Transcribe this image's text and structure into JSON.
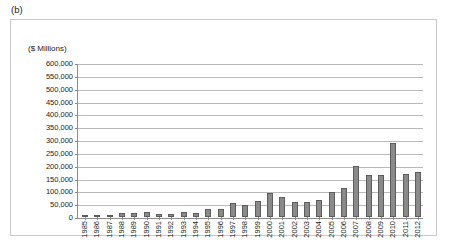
{
  "panel": {
    "label": "(b)"
  },
  "chart_data": {
    "type": "bar",
    "title": "",
    "subtitle": "",
    "ylabel": "($ Millions)",
    "xlabel": "",
    "ylim": [
      0,
      600000
    ],
    "ytick_step": 50000,
    "grid": true,
    "legend": "none",
    "bar_color": "#8a8a8a",
    "bar_border_color": "#5d5d5d",
    "ytick_labels": [
      "600,000",
      "550,000",
      "500,000",
      "450,000",
      "400,000",
      "350,000",
      "300,000",
      "250,000",
      "200,000",
      "150,000",
      "100,000",
      "50,000",
      "0"
    ],
    "ytick_values": [
      600000,
      550000,
      500000,
      450000,
      400000,
      350000,
      300000,
      250000,
      200000,
      150000,
      100000,
      50000,
      0
    ],
    "categories": [
      "1985",
      "1986",
      "1987",
      "1988",
      "1989",
      "1990",
      "1991",
      "1992",
      "1993",
      "1994",
      "1995",
      "1996",
      "1997",
      "1998",
      "1999",
      "2000",
      "2001",
      "2002",
      "2003",
      "2004",
      "2005",
      "2006",
      "2007",
      "2008",
      "2009",
      "2010",
      "2011",
      "2012"
    ],
    "values": [
      1000,
      2000,
      7000,
      14000,
      14000,
      20000,
      13000,
      13000,
      19000,
      16000,
      33000,
      33000,
      53000,
      48000,
      62000,
      93000,
      77000,
      60000,
      58000,
      67000,
      98000,
      114000,
      197000,
      163000,
      163000,
      290000,
      168000,
      175000
    ]
  }
}
